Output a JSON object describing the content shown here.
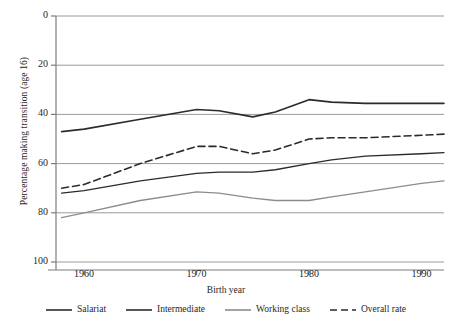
{
  "chart_data": {
    "type": "line",
    "title": "",
    "xlabel": "Birth year",
    "ylabel": "Percentage making transition (age 16)",
    "xlim": [
      1957.5,
      1992
    ],
    "ylim": [
      0,
      100
    ],
    "yticks": [
      0,
      20,
      40,
      60,
      80,
      100
    ],
    "xticks": [
      1960,
      1970,
      1980,
      1990
    ],
    "grid": "horizontal",
    "legend_position": "bottom",
    "x": [
      1958,
      1960,
      1965,
      1970,
      1972,
      1975,
      1977,
      1980,
      1982,
      1985,
      1990,
      1992
    ],
    "series": [
      {
        "name": "Salariat",
        "style": "solid",
        "color": "#2b2b2b",
        "width": 1.6,
        "values": [
          53,
          54,
          58,
          62,
          61.5,
          59,
          61,
          66,
          65,
          64.5,
          64.5,
          64.5
        ]
      },
      {
        "name": "Intermediate",
        "style": "solid",
        "color": "#2b2b2b",
        "width": 1.3,
        "values": [
          28,
          29,
          33,
          36,
          36.5,
          36.5,
          37.5,
          40,
          41.5,
          43,
          44,
          44.5
        ]
      },
      {
        "name": "Working class",
        "style": "solid",
        "color": "#8c8c8c",
        "width": 1.3,
        "values": [
          18,
          20,
          25,
          28.5,
          28,
          26,
          25,
          25,
          26.5,
          28.5,
          32,
          33
        ]
      },
      {
        "name": "Overall rate",
        "style": "dashed",
        "color": "#2b2b2b",
        "width": 1.6,
        "values": [
          30,
          31.5,
          40,
          47,
          47,
          44,
          45.5,
          50,
          50.5,
          50.5,
          51.5,
          52
        ]
      }
    ]
  },
  "axes": {
    "y_tick_labels": [
      "100",
      "80",
      "60",
      "40",
      "20",
      "0"
    ],
    "x_tick_labels": [
      "1960",
      "1970",
      "1980",
      "1990"
    ],
    "x_axis_title": "Birth year",
    "y_axis_title": "Percentage making transition (age 16)"
  },
  "legend": {
    "items": [
      {
        "label": "Salariat",
        "style": "solid",
        "color": "#2b2b2b"
      },
      {
        "label": "Intermediate",
        "style": "solid",
        "color": "#2b2b2b"
      },
      {
        "label": "Working class",
        "style": "solid",
        "color": "#8c8c8c"
      },
      {
        "label": "Overall rate",
        "style": "dashed",
        "color": "#2b2b2b"
      }
    ]
  },
  "colors": {
    "grid": "#9a9a9a",
    "axis": "#7d7d7d",
    "text": "#1f1f1f",
    "background": "#ffffff"
  }
}
